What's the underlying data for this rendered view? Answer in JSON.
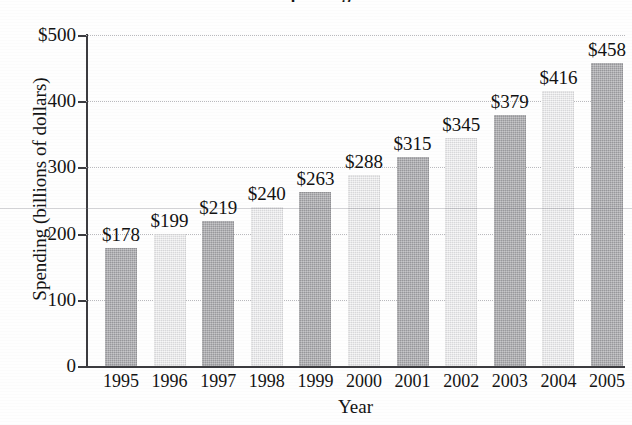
{
  "chart_data": {
    "type": "bar",
    "title": "Spending",
    "xlabel": "Year",
    "ylabel": "Spending (billions of dollars)",
    "categories": [
      "1995",
      "1996",
      "1997",
      "1998",
      "1999",
      "2000",
      "2001",
      "2002",
      "2003",
      "2004",
      "2005"
    ],
    "values": [
      178,
      199,
      219,
      240,
      263,
      288,
      315,
      345,
      379,
      416,
      458
    ],
    "value_labels": [
      "$178",
      "$199",
      "$219",
      "$240",
      "$263",
      "$288",
      "$315",
      "$345",
      "$379",
      "$416",
      "$458"
    ],
    "ylim": [
      0,
      500
    ],
    "yticks": [
      0,
      100,
      200,
      300,
      400,
      500
    ],
    "ytick_labels": [
      "0",
      "100",
      "200",
      "300",
      "400",
      "$500"
    ],
    "grid": true,
    "legend": "none",
    "bar_colors": [
      "#a9a9ad",
      "#e6e6e8"
    ],
    "bar_color_pattern": "alternating dark and light grey",
    "axis_color": "#3c3c40",
    "gridline_color": "#b9b9bd",
    "text_color": "#141414",
    "background": "#fefefe"
  },
  "axes": {
    "y_title": "Spending (billions of dollars)",
    "x_title": "Year"
  }
}
